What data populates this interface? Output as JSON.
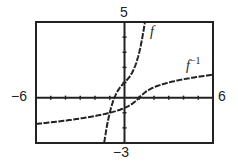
{
  "chart_data": {
    "type": "line",
    "title": "",
    "xlabel": "",
    "ylabel": "",
    "xlim": [
      -6,
      6
    ],
    "ylim": [
      -3,
      5
    ],
    "grid": false,
    "tick_labels": {
      "xmin": "−6",
      "xmax": "6",
      "ymax": "5",
      "ymin": "−3"
    },
    "series": [
      {
        "name": "f",
        "label": "f",
        "formula": "x^3 + x + 1",
        "x": [
          -1.35,
          -1,
          -0.5,
          0,
          0.5,
          1,
          1.35
        ],
        "y": [
          -2.81,
          -1,
          0.38,
          1,
          1.63,
          3,
          4.81
        ]
      },
      {
        "name": "f^-1",
        "label": "f",
        "label_sup": "−1",
        "formula": "inverse of x^3 + x + 1",
        "x": [
          -6,
          -3,
          -1,
          0,
          1,
          3,
          6
        ],
        "y": [
          -1.92,
          -1.38,
          -1,
          -0.68,
          0,
          0.79,
          1.56
        ]
      }
    ]
  }
}
